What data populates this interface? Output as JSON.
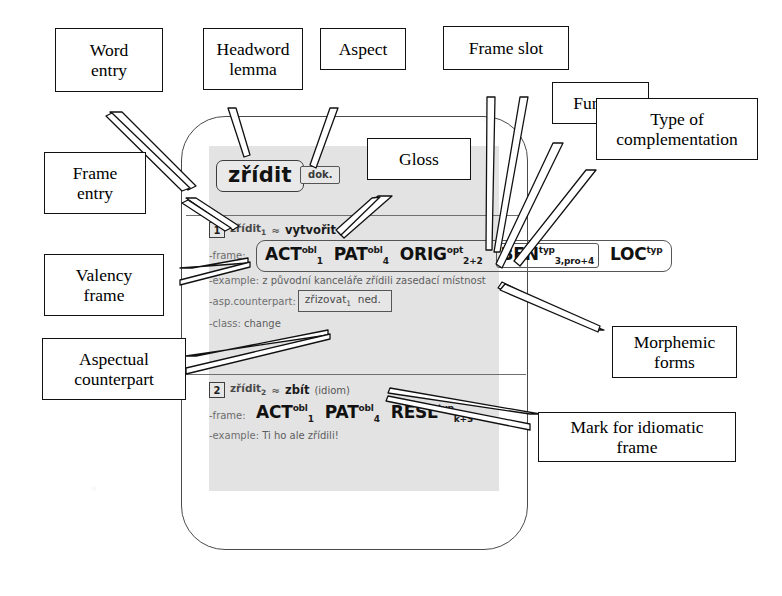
{
  "figure": {
    "ink_color": "#111111",
    "panel_color": "#e3e3e3"
  },
  "entry": {
    "headword": "zřídit",
    "aspect": "dok.",
    "senses": [
      {
        "number": "1",
        "lemma": "zřídit",
        "lemma_index": "1",
        "approx": "≈",
        "gloss": "vytvořit",
        "idiom_mark": "",
        "frame_label": "-frame:",
        "slots": [
          {
            "functor": "ACT",
            "sup": "obl",
            "sub": "1",
            "boxed": false
          },
          {
            "functor": "PAT",
            "sup": "obl",
            "sub": "4",
            "boxed": false
          },
          {
            "functor": "ORIG",
            "sup": "opt",
            "sub": "2+2",
            "boxed": false
          },
          {
            "functor": "BEN",
            "sup": "typ",
            "sub": "3,pro+4",
            "boxed": true
          },
          {
            "functor": "LOC",
            "sup": "typ",
            "sub": "",
            "boxed": false
          }
        ],
        "example_label": "-example:",
        "example": "z původní kanceláře zřídili zasedací místnost",
        "counterpart_label": "-asp.counterpart:",
        "counterpart": "zřizovat",
        "counterpart_index": "1",
        "counterpart_aspect": "ned.",
        "class_label": "-class:",
        "class_value": "change"
      },
      {
        "number": "2",
        "lemma": "zřídit",
        "lemma_index": "2",
        "approx": "≈",
        "gloss": "zbít",
        "idiom_mark": "(idiom)",
        "frame_label": "-frame:",
        "slots": [
          {
            "functor": "ACT",
            "sup": "obl",
            "sub": "1",
            "boxed": false
          },
          {
            "functor": "PAT",
            "sup": "obl",
            "sub": "4",
            "boxed": false
          },
          {
            "functor": "RESL",
            "sup": "typ",
            "sub": "k+3",
            "boxed": false
          }
        ],
        "example_label": "-example:",
        "example": "Ti ho ale zřídili!"
      }
    ]
  },
  "annotations": {
    "word_entry": "Word\nentry",
    "headword_lemma": "Headword\nlemma",
    "aspect": "Aspect",
    "frame_slot": "Frame slot",
    "functor": "Functor",
    "type_of_complementation": "Type of\ncomplementation",
    "gloss": "Gloss",
    "frame_entry": "Frame\nentry",
    "valency_frame": "Valency\nframe",
    "aspectual_counterpart": "Aspectual\ncounterpart",
    "morphemic_forms": "Morphemic\nforms",
    "mark_for_idiomatic_frame": "Mark for idiomatic\nframe"
  }
}
